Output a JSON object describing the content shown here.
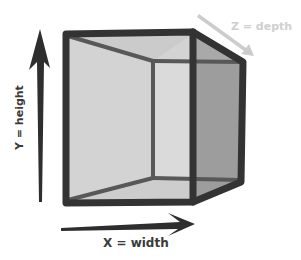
{
  "diagram": {
    "type": "3d-cube-axes",
    "axes": {
      "x": {
        "label": "X = width",
        "color": "#2e2e2e"
      },
      "y": {
        "label": "Y = height",
        "color": "#2e2e2e"
      },
      "z": {
        "label": "Z = depth",
        "color": "#c8c8c8"
      }
    },
    "colors": {
      "edge": "#333333",
      "inner_edge": "#555555",
      "front_face": "#d4d4d4",
      "back_face": "#d9d9d9",
      "right_face": "#9e9e9e",
      "top_face": "#bdbdbd",
      "label_dark": "#3a3a3a",
      "label_light": "#cfcfcf"
    }
  }
}
